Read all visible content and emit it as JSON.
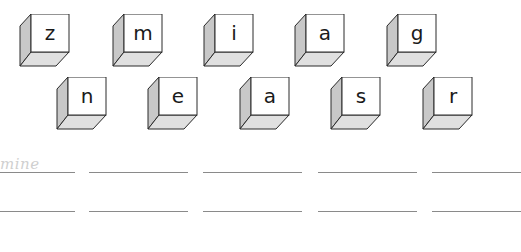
{
  "worksheet": {
    "cubes_row1": [
      {
        "letter": "z",
        "x": 19,
        "y": 14
      },
      {
        "letter": "m",
        "x": 112,
        "y": 14
      },
      {
        "letter": "i",
        "x": 203,
        "y": 14
      },
      {
        "letter": "a",
        "x": 294,
        "y": 14
      },
      {
        "letter": "g",
        "x": 386,
        "y": 14
      }
    ],
    "cubes_row2": [
      {
        "letter": "n",
        "x": 56,
        "y": 77
      },
      {
        "letter": "e",
        "x": 147,
        "y": 77
      },
      {
        "letter": "a",
        "x": 239,
        "y": 77
      },
      {
        "letter": "s",
        "x": 330,
        "y": 77
      },
      {
        "letter": "r",
        "x": 422,
        "y": 77
      }
    ],
    "example_answer": "mine",
    "answer_lines": {
      "rows_y": [
        172,
        211
      ],
      "segments": [
        [
          0,
          75
        ],
        [
          89,
          188
        ],
        [
          203,
          302
        ],
        [
          318,
          417
        ],
        [
          432,
          521
        ]
      ]
    },
    "colors": {
      "cube_front": "#ffffff",
      "cube_side": "#c8c8c8",
      "cube_bottom": "#e0e0e0",
      "cube_outline": "#2a2a2a",
      "line": "#8a8a8a",
      "example_text": "#cfcfcf"
    }
  }
}
